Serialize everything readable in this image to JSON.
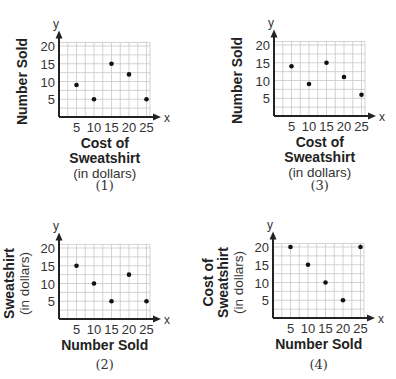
{
  "chart_data": [
    {
      "id": "1",
      "type": "scatter",
      "caption": "(1)",
      "x_axis_symbol": "x",
      "y_axis_symbol": "y",
      "xlabel": [
        "Cost of",
        "Sweatshirt",
        "(in dollars)"
      ],
      "ylabel": [
        "Number Sold"
      ],
      "xticks": [
        5,
        10,
        15,
        20,
        25
      ],
      "yticks": [
        5,
        10,
        15,
        20
      ],
      "xlim": [
        0,
        26
      ],
      "ylim": [
        0,
        21
      ],
      "grid": true,
      "points": [
        [
          5,
          9
        ],
        [
          10,
          5
        ],
        [
          15,
          15
        ],
        [
          20,
          12
        ],
        [
          25,
          5
        ]
      ]
    },
    {
      "id": "3",
      "type": "scatter",
      "caption": "(3)",
      "x_axis_symbol": "x",
      "y_axis_symbol": "y",
      "xlabel": [
        "Cost of",
        "Sweatshirt",
        "(in dollars)"
      ],
      "ylabel": [
        "Number Sold"
      ],
      "xticks": [
        5,
        10,
        15,
        20,
        25
      ],
      "yticks": [
        5,
        10,
        15,
        20
      ],
      "xlim": [
        0,
        26
      ],
      "ylim": [
        0,
        21
      ],
      "grid": true,
      "points": [
        [
          5,
          14
        ],
        [
          10,
          9
        ],
        [
          15,
          15
        ],
        [
          20,
          11
        ],
        [
          25,
          6
        ]
      ]
    },
    {
      "id": "2",
      "type": "scatter",
      "caption": "(2)",
      "x_axis_symbol": "x",
      "y_axis_symbol": "y",
      "xlabel": [
        "Number Sold"
      ],
      "ylabel": [
        "Cost of",
        "Sweatshirt",
        "(in dollars)"
      ],
      "xticks": [
        5,
        10,
        15,
        20,
        25
      ],
      "yticks": [
        5,
        10,
        15,
        20
      ],
      "xlim": [
        0,
        26
      ],
      "ylim": [
        0,
        21
      ],
      "grid": true,
      "points": [
        [
          5,
          15
        ],
        [
          10,
          10
        ],
        [
          15,
          5
        ],
        [
          20,
          12.5
        ],
        [
          25,
          5
        ]
      ]
    },
    {
      "id": "4",
      "type": "scatter",
      "caption": "(4)",
      "x_axis_symbol": "x",
      "y_axis_symbol": "y",
      "xlabel": [
        "Number Sold"
      ],
      "ylabel": [
        "Cost of",
        "Sweatshirt",
        "(in dollars)"
      ],
      "xticks": [
        5,
        10,
        15,
        20,
        25
      ],
      "yticks": [
        5,
        10,
        15,
        20
      ],
      "xlim": [
        0,
        26
      ],
      "ylim": [
        0,
        21
      ],
      "grid": true,
      "points": [
        [
          5,
          20
        ],
        [
          10,
          15
        ],
        [
          15,
          10
        ],
        [
          20,
          5
        ],
        [
          25,
          20
        ]
      ]
    }
  ],
  "layout": {
    "panels": [
      {
        "chart_index": 0,
        "origin_x": 59,
        "origin_y": 117,
        "caption_y": 190
      },
      {
        "chart_index": 1,
        "origin_x": 274,
        "origin_y": 116,
        "caption_y": 190
      },
      {
        "chart_index": 2,
        "origin_x": 59,
        "origin_y": 319,
        "caption_y": 369
      },
      {
        "chart_index": 3,
        "origin_x": 273,
        "origin_y": 318,
        "caption_y": 369
      }
    ]
  }
}
